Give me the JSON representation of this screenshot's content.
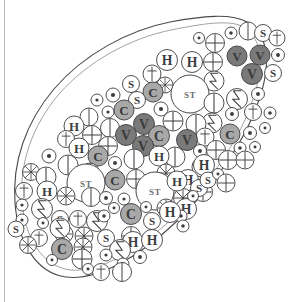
{
  "figure": {
    "canvas": {
      "width": 291,
      "height": 302
    },
    "background_color": "#ffffff",
    "page_edge_rule_color": "#b9b9bb"
  },
  "outline": {
    "name": "tissue-outline",
    "shape": "teardrop",
    "stroke_color": "#4a4a4d",
    "inner_stroke_color": "#8a8a8e",
    "fill_color": "#ffffff",
    "stroke_width": 1.1,
    "outer_path": "M 247 22 C 268 34 272 62 259 100 C 246 140 214 186 176 222 C 138 258 96 281 66 277 C 36 273 18 242 15 203 C 12 162 26 122 54 89 C 84 54 129 30 170 22 C 202 16 231 13 247 22 Z",
    "inner_path": "M 244 27 C 262 39 265 64 253 99 C 241 137 211 182 175 216 C 139 250 99 273 70 270 C 42 266 25 238 22 202 C 19 164 32 126 59 94 C 88 61 131 38 171 30 C 201 24 229 19 244 27 Z"
  },
  "legend": {
    "marker_types": [
      {
        "key": "plus",
        "glyph_name": "circled-plus-icon",
        "label": ""
      },
      {
        "key": "dot",
        "glyph_name": "circled-dot-icon",
        "label": ""
      },
      {
        "key": "smalldot",
        "glyph_name": "small-circled-dot-icon",
        "label": ""
      },
      {
        "key": "line",
        "glyph_name": "circled-vertical-line-icon",
        "label": ""
      },
      {
        "key": "S",
        "glyph_name": "letter-s-icon",
        "label": "S"
      },
      {
        "key": "dagger",
        "glyph_name": "dagger-cross-icon",
        "label": ""
      },
      {
        "key": "H",
        "glyph_name": "letter-h-icon",
        "label": "H"
      },
      {
        "key": "bolt",
        "glyph_name": "lightning-bolt-icon",
        "label": ""
      },
      {
        "key": "star",
        "glyph_name": "spoke-wheel-icon",
        "label": ""
      },
      {
        "key": "C",
        "glyph_name": "letter-c-filled-icon",
        "label": "C"
      },
      {
        "key": "V",
        "glyph_name": "letter-v-filled-icon",
        "label": "V"
      },
      {
        "key": "ST",
        "glyph_name": "stem-cell-icon",
        "label": "ST"
      }
    ]
  },
  "colors": {
    "cell_stroke": "#3d3d40",
    "cell_fill_plain": "#ffffff",
    "cell_fill_C": "#a8a8a8",
    "cell_fill_V": "#7a7a7a",
    "cell_fill_ST": "#ffffff",
    "glyph_ink": "#3d3d40",
    "glyph_ink_on_fill": "#3a3a3a",
    "st_ink": "#6f6f72"
  },
  "cells": [
    {
      "t": "dot",
      "x": 231,
      "y": 33,
      "r": 6.0
    },
    {
      "t": "line",
      "x": 248,
      "y": 31,
      "r": 9.0
    },
    {
      "t": "S",
      "x": 263,
      "y": 33,
      "r": 8.5
    },
    {
      "t": "dagger",
      "x": 277,
      "y": 38,
      "r": 8.0
    },
    {
      "t": "plus",
      "x": 215,
      "y": 43,
      "r": 9.5
    },
    {
      "t": "smalldot",
      "x": 199,
      "y": 38,
      "r": 5.5
    },
    {
      "t": "plus",
      "x": 213,
      "y": 62,
      "r": 9.5
    },
    {
      "t": "V",
      "x": 237,
      "y": 56,
      "r": 10.0
    },
    {
      "t": "V",
      "x": 260,
      "y": 55,
      "r": 10.0
    },
    {
      "t": "dot",
      "x": 278,
      "y": 55,
      "r": 6.5
    },
    {
      "t": "H",
      "x": 167,
      "y": 60,
      "r": 10.5
    },
    {
      "t": "H",
      "x": 192,
      "y": 62,
      "r": 10.5
    },
    {
      "t": "V",
      "x": 252,
      "y": 74,
      "r": 10.5
    },
    {
      "t": "S",
      "x": 273,
      "y": 73,
      "r": 8.5
    },
    {
      "t": "dagger",
      "x": 152,
      "y": 74,
      "r": 9.0
    },
    {
      "t": "star",
      "x": 165,
      "y": 85,
      "r": 8.0
    },
    {
      "t": "bolt",
      "x": 214,
      "y": 81,
      "r": 10.0
    },
    {
      "t": "S",
      "x": 131,
      "y": 84,
      "r": 8.5
    },
    {
      "t": "C",
      "x": 153,
      "y": 92,
      "r": 10.0
    },
    {
      "t": "ST",
      "x": 190,
      "y": 94,
      "r": 19.0
    },
    {
      "t": "line",
      "x": 214,
      "y": 103,
      "r": 10.0
    },
    {
      "t": "bolt",
      "x": 237,
      "y": 99,
      "r": 10.5
    },
    {
      "t": "dot",
      "x": 258,
      "y": 94,
      "r": 6.5
    },
    {
      "t": "dot",
      "x": 113,
      "y": 95,
      "r": 7.0
    },
    {
      "t": "S",
      "x": 137,
      "y": 100,
      "r": 8.5
    },
    {
      "t": "smalldot",
      "x": 97,
      "y": 100,
      "r": 6.0
    },
    {
      "t": "smalldot",
      "x": 108,
      "y": 112,
      "r": 6.0
    },
    {
      "t": "C",
      "x": 124,
      "y": 110,
      "r": 10.0
    },
    {
      "t": "dot",
      "x": 161,
      "y": 109,
      "r": 7.0
    },
    {
      "t": "bolt",
      "x": 212,
      "y": 123,
      "r": 10.0
    },
    {
      "t": "dot",
      "x": 232,
      "y": 114,
      "r": 6.5
    },
    {
      "t": "dagger",
      "x": 253,
      "y": 112,
      "r": 8.5
    },
    {
      "t": "line",
      "x": 89,
      "y": 117,
      "r": 9.0
    },
    {
      "t": "line",
      "x": 110,
      "y": 128,
      "r": 9.5
    },
    {
      "t": "V",
      "x": 144,
      "y": 124,
      "r": 10.5
    },
    {
      "t": "plus",
      "x": 173,
      "y": 121,
      "r": 10.0
    },
    {
      "t": "line",
      "x": 196,
      "y": 124,
      "r": 10.0
    },
    {
      "t": "dot",
      "x": 270,
      "y": 113,
      "r": 6.0
    },
    {
      "t": "H",
      "x": 74,
      "y": 126,
      "r": 10.0
    },
    {
      "t": "plus",
      "x": 92,
      "y": 135,
      "r": 9.5
    },
    {
      "t": "V",
      "x": 126,
      "y": 135,
      "r": 10.5
    },
    {
      "t": "C",
      "x": 159,
      "y": 136,
      "r": 10.5
    },
    {
      "t": "dagger",
      "x": 205,
      "y": 137,
      "r": 9.0
    },
    {
      "t": "C",
      "x": 230,
      "y": 134,
      "r": 10.0
    },
    {
      "t": "dot",
      "x": 250,
      "y": 133,
      "r": 6.5
    },
    {
      "t": "dagger",
      "x": 66,
      "y": 139,
      "r": 8.5
    },
    {
      "t": "H",
      "x": 79,
      "y": 148,
      "r": 10.0
    },
    {
      "t": "plus",
      "x": 108,
      "y": 146,
      "r": 9.5
    },
    {
      "t": "V",
      "x": 143,
      "y": 146,
      "r": 10.5
    },
    {
      "t": "V",
      "x": 187,
      "y": 140,
      "r": 10.5
    },
    {
      "t": "dot",
      "x": 200,
      "y": 151,
      "r": 6.5
    },
    {
      "t": "plus",
      "x": 216,
      "y": 150,
      "r": 9.5
    },
    {
      "t": "dot",
      "x": 240,
      "y": 148,
      "r": 6.0
    },
    {
      "t": "dot",
      "x": 49,
      "y": 156,
      "r": 7.0
    },
    {
      "t": "C",
      "x": 98,
      "y": 156,
      "r": 10.0
    },
    {
      "t": "line",
      "x": 134,
      "y": 159,
      "r": 10.0
    },
    {
      "t": "line",
      "x": 175,
      "y": 157,
      "r": 10.0
    },
    {
      "t": "plus",
      "x": 228,
      "y": 160,
      "r": 9.5
    },
    {
      "t": "line",
      "x": 68,
      "y": 165,
      "r": 10.0
    },
    {
      "t": "dot",
      "x": 115,
      "y": 163,
      "r": 6.5
    },
    {
      "t": "H",
      "x": 159,
      "y": 156,
      "r": 10.0
    },
    {
      "t": "line",
      "x": 202,
      "y": 167,
      "r": 10.0
    },
    {
      "t": "star",
      "x": 31,
      "y": 172,
      "r": 8.5
    },
    {
      "t": "line",
      "x": 46,
      "y": 177,
      "r": 10.0
    },
    {
      "t": "line",
      "x": 90,
      "y": 172,
      "r": 9.0
    },
    {
      "t": "star",
      "x": 166,
      "y": 173,
      "r": 9.0
    },
    {
      "t": "H",
      "x": 204,
      "y": 165,
      "r": 10.5
    },
    {
      "t": "ST",
      "x": 86,
      "y": 183,
      "r": 19.0
    },
    {
      "t": "C",
      "x": 115,
      "y": 180,
      "r": 10.0
    },
    {
      "t": "plus",
      "x": 136,
      "y": 179,
      "r": 9.5
    },
    {
      "t": "H",
      "x": 188,
      "y": 180,
      "r": 10.5
    },
    {
      "t": "dagger",
      "x": 24,
      "y": 191,
      "r": 8.5
    },
    {
      "t": "H",
      "x": 47,
      "y": 191,
      "r": 10.0
    },
    {
      "t": "star",
      "x": 66,
      "y": 196,
      "r": 9.0
    },
    {
      "t": "line",
      "x": 91,
      "y": 197,
      "r": 9.5
    },
    {
      "t": "ST",
      "x": 155,
      "y": 191,
      "r": 19.0
    },
    {
      "t": "star",
      "x": 183,
      "y": 198,
      "r": 9.5
    },
    {
      "t": "plus",
      "x": 203,
      "y": 192,
      "r": 9.5
    },
    {
      "t": "smalldot",
      "x": 22,
      "y": 205,
      "r": 6.0
    },
    {
      "t": "bolt",
      "x": 42,
      "y": 209,
      "r": 10.5
    },
    {
      "t": "dot",
      "x": 106,
      "y": 198,
      "r": 6.5
    },
    {
      "t": "smalldot",
      "x": 124,
      "y": 199,
      "r": 6.0
    },
    {
      "t": "H",
      "x": 177,
      "y": 181,
      "r": 10.0
    },
    {
      "t": "S",
      "x": 199,
      "y": 188,
      "r": 8.5
    },
    {
      "t": "smalldot",
      "x": 22,
      "y": 220,
      "r": 6.0
    },
    {
      "t": "S",
      "x": 60,
      "y": 219,
      "r": 8.5
    },
    {
      "t": "dagger",
      "x": 78,
      "y": 219,
      "r": 8.5
    },
    {
      "t": "bolt",
      "x": 97,
      "y": 221,
      "r": 10.5
    },
    {
      "t": "star",
      "x": 166,
      "y": 208,
      "r": 9.0
    },
    {
      "t": "H",
      "x": 186,
      "y": 209,
      "r": 10.5
    },
    {
      "t": "dot",
      "x": 181,
      "y": 216,
      "r": 6.0
    },
    {
      "t": "star",
      "x": 64,
      "y": 234,
      "r": 9.0
    },
    {
      "t": "dagger",
      "x": 39,
      "y": 238,
      "r": 8.5
    },
    {
      "t": "star",
      "x": 84,
      "y": 236,
      "r": 9.0
    },
    {
      "t": "S",
      "x": 106,
      "y": 238,
      "r": 8.5
    },
    {
      "t": "C",
      "x": 131,
      "y": 214,
      "r": 10.5
    },
    {
      "t": "S",
      "x": 152,
      "y": 221,
      "r": 8.5
    },
    {
      "t": "H",
      "x": 170,
      "y": 212,
      "r": 10.5
    },
    {
      "t": "dot",
      "x": 183,
      "y": 226,
      "r": 6.0
    },
    {
      "t": "C",
      "x": 62,
      "y": 249,
      "r": 10.5
    },
    {
      "t": "star",
      "x": 28,
      "y": 245,
      "r": 8.5
    },
    {
      "t": "star",
      "x": 83,
      "y": 247,
      "r": 9.0
    },
    {
      "t": "plus",
      "x": 82,
      "y": 259,
      "r": 10.0
    },
    {
      "t": "plus",
      "x": 131,
      "y": 236,
      "r": 9.5
    },
    {
      "t": "H",
      "x": 133,
      "y": 242,
      "r": 10.5
    },
    {
      "t": "bolt",
      "x": 120,
      "y": 250,
      "r": 10.5
    },
    {
      "t": "smalldot",
      "x": 106,
      "y": 255,
      "r": 6.0
    },
    {
      "t": "smalldot",
      "x": 52,
      "y": 260,
      "r": 5.5
    },
    {
      "t": "H",
      "x": 152,
      "y": 240,
      "r": 10.5
    },
    {
      "t": "dot",
      "x": 140,
      "y": 257,
      "r": 6.5
    },
    {
      "t": "dot",
      "x": 123,
      "y": 264,
      "r": 6.0
    },
    {
      "t": "line",
      "x": 122,
      "y": 272,
      "r": 9.5
    },
    {
      "t": "dagger",
      "x": 101,
      "y": 272,
      "r": 8.5
    },
    {
      "t": "smalldot",
      "x": 88,
      "y": 269,
      "r": 5.5
    },
    {
      "t": "bolt",
      "x": 60,
      "y": 228,
      "r": 10.0
    },
    {
      "t": "smalldot",
      "x": 43,
      "y": 223,
      "r": 5.5
    },
    {
      "t": "S",
      "x": 16,
      "y": 229,
      "r": 8.0
    },
    {
      "t": "S",
      "x": 208,
      "y": 180,
      "r": 8.0
    },
    {
      "t": "smalldot",
      "x": 193,
      "y": 196,
      "r": 5.5
    },
    {
      "t": "smalldot",
      "x": 146,
      "y": 207,
      "r": 5.5
    },
    {
      "t": "smalldot",
      "x": 114,
      "y": 208,
      "r": 5.5
    },
    {
      "t": "dot",
      "x": 104,
      "y": 216,
      "r": 6.0
    },
    {
      "t": "smalldot",
      "x": 265,
      "y": 128,
      "r": 5.5
    },
    {
      "t": "plus",
      "x": 245,
      "y": 160,
      "r": 9.0
    },
    {
      "t": "smalldot",
      "x": 255,
      "y": 147,
      "r": 5.5
    },
    {
      "t": "smalldot",
      "x": 218,
      "y": 174,
      "r": 5.5
    },
    {
      "t": "plus",
      "x": 226,
      "y": 183,
      "r": 9.0
    }
  ]
}
